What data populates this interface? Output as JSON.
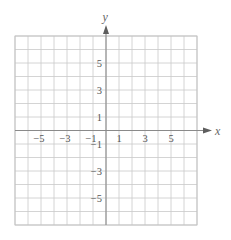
{
  "chart_data": {
    "type": "scatter",
    "title": "",
    "xlabel": "x",
    "ylabel": "y",
    "xlim": [
      -7,
      7
    ],
    "ylim": [
      -7,
      7
    ],
    "grid": true,
    "grid_step": 1,
    "x_tick_labels": [
      {
        "value": -5,
        "label": "−5"
      },
      {
        "value": -3,
        "label": "−3"
      },
      {
        "value": -1,
        "label": "−1"
      },
      {
        "value": 1,
        "label": "1"
      },
      {
        "value": 3,
        "label": "3"
      },
      {
        "value": 5,
        "label": "5"
      }
    ],
    "y_tick_labels": [
      {
        "value": 5,
        "label": "5"
      },
      {
        "value": 3,
        "label": "3"
      },
      {
        "value": 1,
        "label": "1"
      },
      {
        "value": -1,
        "label": "−1"
      },
      {
        "value": -3,
        "label": "−3"
      },
      {
        "value": -5,
        "label": "−5"
      }
    ],
    "series": [],
    "legend": null
  },
  "axes": {
    "x_label": "x",
    "y_label": "y"
  },
  "colors": {
    "grid": "#c9c9c9",
    "axis": "#8a8a8a",
    "text": "#555555"
  }
}
